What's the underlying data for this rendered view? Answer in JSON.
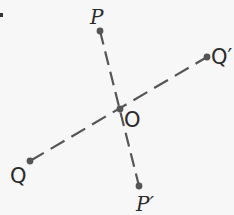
{
  "diagram": {
    "colors": {
      "line": "#555555",
      "point": "#555555",
      "label": "#2b2b2b",
      "background": "#f7f7f7"
    },
    "points": {
      "P": {
        "label": "P",
        "x": 100,
        "y": 31
      },
      "P_prime": {
        "label": "P′",
        "x": 139,
        "y": 186
      },
      "Q": {
        "label": "Q",
        "x": 30,
        "y": 161
      },
      "Q_prime": {
        "label": "Q′",
        "x": 207,
        "y": 57
      },
      "O": {
        "label": "O",
        "x": 120,
        "y": 109
      }
    },
    "segments": [
      {
        "from": "P",
        "to": "P_prime",
        "style": "dashed"
      },
      {
        "from": "Q",
        "to": "Q_prime",
        "style": "dashed"
      }
    ],
    "fragment_marker": "."
  }
}
